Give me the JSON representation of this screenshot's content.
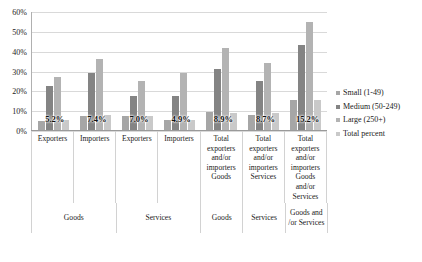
{
  "chart_data": {
    "type": "bar",
    "title": "",
    "xlabel": "",
    "ylabel": "",
    "ylim": [
      0,
      60
    ],
    "grid": true,
    "legend_position": "right",
    "ytick_labels": [
      "60%",
      "50%",
      "40%",
      "30%",
      "20%",
      "10%",
      "0%"
    ],
    "ytick_values": [
      60,
      50,
      40,
      30,
      20,
      10,
      0
    ],
    "categories": [
      "Exporters",
      "Importers",
      "Exporters",
      "Importers",
      "Total exporters and/or importers Goods",
      "Total exporters and/or importers Services",
      "Total exporters and/or importers Goods and/or Services"
    ],
    "category_lines": [
      [
        "Exporters"
      ],
      [
        "Importers"
      ],
      [
        "Exporters"
      ],
      [
        "Importers"
      ],
      [
        "Total",
        "exporters",
        "and/or",
        "importers",
        "Goods"
      ],
      [
        "Total",
        "exporters",
        "and/or",
        "importers",
        "Services"
      ],
      [
        "Total",
        "exporters",
        "and/or",
        "importers",
        "Goods",
        "and/or",
        "Services"
      ]
    ],
    "group_labels": [
      "Goods",
      "Services",
      "Goods",
      "Services",
      "Goods and /or Services"
    ],
    "group_spans": [
      2,
      2,
      1,
      1,
      1
    ],
    "series": [
      {
        "name": "Small (1-49)",
        "values": [
          4.8,
          7.0,
          7.2,
          5.2,
          9.2,
          7.8,
          15.2
        ]
      },
      {
        "name": "Medium (50-249)",
        "values": [
          22.2,
          28.8,
          17.2,
          17.2,
          31.0,
          24.8,
          43.2
        ]
      },
      {
        "name": "Large (250+)",
        "values": [
          27.0,
          36.2,
          25.0,
          29.2,
          41.8,
          34.2,
          54.8
        ]
      },
      {
        "name": "Total percent",
        "values": [
          5.2,
          7.4,
          7.0,
          4.9,
          8.9,
          8.7,
          15.2
        ]
      }
    ],
    "data_labels": [
      "5.2%",
      "7.4%",
      "7.0%",
      "4.9%",
      "8.9%",
      "8.7%",
      "15.2%"
    ]
  },
  "legend": {
    "items": [
      {
        "label": "Small (1-49)",
        "color": "#a6a6a6"
      },
      {
        "label": "Medium (50-249)",
        "color": "#848484"
      },
      {
        "label": "Large (250+)",
        "color": "#b3b3b3"
      },
      {
        "label": "Total percent",
        "color": "#c9c9c9"
      }
    ]
  }
}
